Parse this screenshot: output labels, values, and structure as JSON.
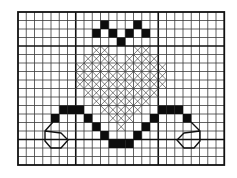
{
  "pattern": {
    "title": "",
    "type": "cross-stitch chart",
    "grid": {
      "cols": 25,
      "rows": 18,
      "origin_x": 18,
      "origin_y": 12,
      "cell_w": 8.25,
      "cell_h": 8.5,
      "thick_cols": [
        7,
        17
      ],
      "thick_rows": [
        4,
        15
      ]
    },
    "colors": {
      "grid_line": "#3a3a3a",
      "grid_major": "#111111",
      "solid": "#0d0d0d",
      "background": "#ffffff"
    },
    "symbols": {
      "solid": "filled-square",
      "cross": "x-stitch"
    },
    "solid_cells": [
      [
        1,
        10
      ],
      [
        1,
        14
      ],
      [
        2,
        9
      ],
      [
        2,
        11
      ],
      [
        2,
        13
      ],
      [
        2,
        15
      ],
      [
        3,
        12
      ],
      [
        11,
        5
      ],
      [
        11,
        6
      ],
      [
        11,
        7
      ],
      [
        11,
        17
      ],
      [
        11,
        18
      ],
      [
        11,
        19
      ],
      [
        12,
        4
      ],
      [
        12,
        8
      ],
      [
        12,
        16
      ],
      [
        12,
        20
      ],
      [
        13,
        9
      ],
      [
        13,
        15
      ],
      [
        14,
        10
      ],
      [
        14,
        14
      ],
      [
        15,
        11
      ],
      [
        15,
        12
      ],
      [
        15,
        13
      ]
    ],
    "cross_rows": [
      {
        "row": 4,
        "spans": [
          [
            9,
            10
          ],
          [
            14,
            15
          ]
        ]
      },
      {
        "row": 5,
        "spans": [
          [
            8,
            11
          ],
          [
            13,
            16
          ]
        ]
      },
      {
        "row": 6,
        "spans": [
          [
            7,
            17
          ]
        ]
      },
      {
        "row": 7,
        "spans": [
          [
            7,
            17
          ]
        ]
      },
      {
        "row": 8,
        "spans": [
          [
            7,
            17
          ]
        ]
      },
      {
        "row": 9,
        "spans": [
          [
            8,
            16
          ]
        ]
      },
      {
        "row": 10,
        "spans": [
          [
            9,
            15
          ]
        ]
      },
      {
        "row": 11,
        "spans": [
          [
            10,
            14
          ]
        ]
      },
      {
        "row": 12,
        "spans": [
          [
            11,
            13
          ]
        ]
      },
      {
        "row": 13,
        "spans": [
          [
            12,
            12
          ]
        ]
      }
    ],
    "backstitch": [
      {
        "name": "left-swirl",
        "points": [
          [
            53,
            122
          ],
          [
            45,
            131
          ],
          [
            45,
            141
          ],
          [
            51,
            148
          ],
          [
            61,
            148
          ],
          [
            68,
            140
          ],
          [
            61,
            133
          ],
          [
            45,
            131
          ]
        ]
      },
      {
        "name": "right-swirl",
        "points": [
          [
            191,
            122
          ],
          [
            200,
            131
          ],
          [
            200,
            141
          ],
          [
            194,
            148
          ],
          [
            184,
            148
          ],
          [
            177,
            140
          ],
          [
            184,
            133
          ],
          [
            200,
            131
          ]
        ]
      }
    ]
  }
}
